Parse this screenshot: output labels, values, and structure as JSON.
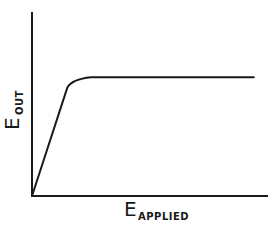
{
  "chart_data": {
    "type": "line",
    "title": "",
    "xlabel": "E_APPLIED",
    "ylabel": "E_OUT",
    "xlabel_main": "E",
    "xlabel_sub": "APPLIED",
    "ylabel_main": "E",
    "ylabel_sub": "OUT",
    "grid": false,
    "legend": null,
    "ticks": false,
    "xlim": [
      0,
      1
    ],
    "ylim": [
      0,
      1
    ],
    "series": [
      {
        "name": "E_OUT vs E_APPLIED",
        "description": "Linear rise from origin, sharp knee, then flat saturation plateau",
        "x": [
          0.0,
          0.15,
          0.17,
          0.2,
          0.25,
          0.35,
          0.5,
          0.75,
          0.94
        ],
        "y": [
          0.0,
          0.59,
          0.62,
          0.64,
          0.645,
          0.645,
          0.645,
          0.645,
          0.645
        ]
      }
    ]
  },
  "colors": {
    "line": "#1a1a1a",
    "background": "#ffffff"
  }
}
